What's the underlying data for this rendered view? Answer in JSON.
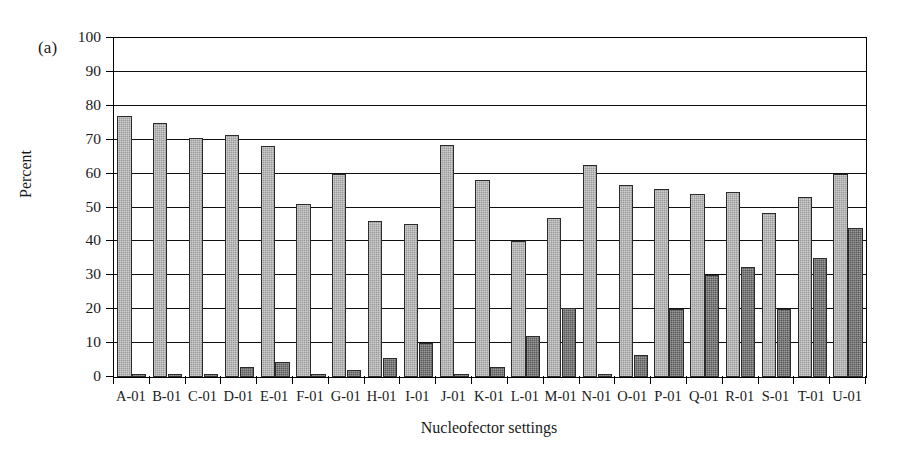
{
  "figure": {
    "panel_label": "(a)",
    "background_color": "#ffffff"
  },
  "chart_data": {
    "type": "bar",
    "title": "",
    "panel_label": "(a)",
    "xlabel": "Nucleofector settings",
    "ylabel": "Percent",
    "ylim": [
      0,
      100
    ],
    "ytick_step": 10,
    "yticks": [
      0,
      10,
      20,
      30,
      40,
      50,
      60,
      70,
      80,
      90,
      100
    ],
    "ytick_labels": [
      "0",
      "10",
      "20",
      "30",
      "40",
      "50",
      "60",
      "70",
      "80",
      "90",
      "100"
    ],
    "grid": true,
    "grid_axis": "y",
    "legend": false,
    "legend_position": "none",
    "categories": [
      "A-01",
      "B-01",
      "C-01",
      "D-01",
      "E-01",
      "F-01",
      "G-01",
      "H-01",
      "I-01",
      "J-01",
      "K-01",
      "L-01",
      "M-01",
      "N-01",
      "O-01",
      "P-01",
      "Q-01",
      "R-01",
      "S-01",
      "T-01",
      "U-01"
    ],
    "series": [
      {
        "name": "series-1",
        "color": "#9a9a9a",
        "fill": "light-gray-hatched",
        "values": [
          77,
          75,
          70.5,
          71.5,
          68,
          51,
          60,
          46,
          45,
          68.5,
          58,
          40,
          47,
          62.5,
          56.5,
          55.5,
          54,
          54.5,
          48.5,
          53,
          60
        ]
      },
      {
        "name": "series-2",
        "color": "#595959",
        "fill": "dark-gray-hatched",
        "values": [
          1,
          1,
          1,
          3,
          4.5,
          1,
          2,
          5.5,
          10,
          1,
          3,
          12,
          20.5,
          1,
          6.5,
          20,
          30,
          32.5,
          20,
          35,
          44
        ]
      }
    ]
  }
}
